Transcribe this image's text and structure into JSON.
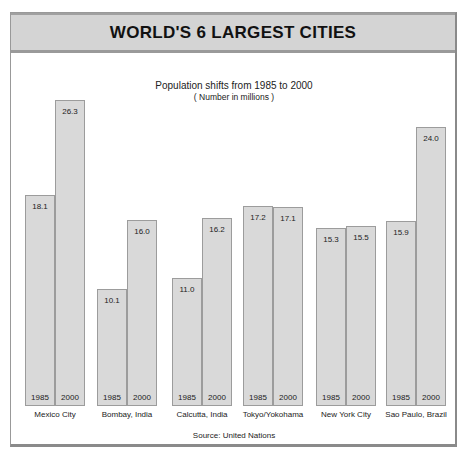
{
  "chart_data": {
    "type": "bar",
    "title": "WORLD'S 6 LARGEST CITIES",
    "subtitle": "Population shifts from 1985 to 2000",
    "note": "( Number in millions )",
    "source": "Source: United Nations",
    "categories": [
      "Mexico City",
      "Bombay, India",
      "Calcutta, India",
      "Tokyo/Yokohama",
      "New York City",
      "Sao Paulo, Brazil"
    ],
    "series": [
      {
        "name": "1985",
        "values": [
          18.1,
          10.1,
          11.0,
          17.2,
          15.3,
          15.9
        ]
      },
      {
        "name": "2000",
        "values": [
          26.3,
          16.0,
          16.2,
          17.1,
          15.5,
          24.0
        ]
      }
    ],
    "value_labels": {
      "1985": [
        "18.1",
        "10.1",
        "11.0",
        "17.2",
        "15.3",
        "15.9"
      ],
      "2000": [
        "26.3",
        "16.0",
        "16.2",
        "17.1",
        "15.5",
        "24.0"
      ]
    },
    "xlabel": "",
    "ylabel": "Population (millions)",
    "grid": false,
    "legend": "years labeled at bar bases"
  },
  "colors": {
    "bar_fill": "#d9d9d9",
    "bar_border": "#9c9c9c",
    "header_bg": "#d4d4d4"
  }
}
